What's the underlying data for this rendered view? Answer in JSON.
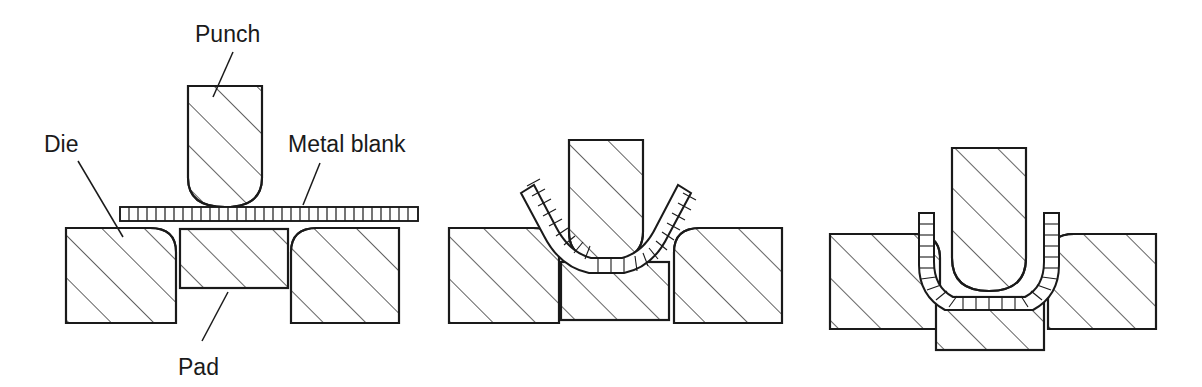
{
  "figure": {
    "background_color": "#ffffff",
    "line_color": "#1a1a1a",
    "hatch_color": "#3c3c3c",
    "width": 1202,
    "height": 387
  },
  "labels": {
    "punch": "Punch",
    "die": "Die",
    "metal_blank": "Metal blank",
    "pad": "Pad"
  },
  "stages": [
    {
      "index": 1,
      "name": "stage-1-initial",
      "description": "Flat metal blank resting on die and pad, punch raised above",
      "blank_state": "flat",
      "punch_position": "raised",
      "pad_position": "up",
      "has_labels": true
    },
    {
      "index": 2,
      "name": "stage-2-partial-bend",
      "description": "Punch descending, blank bent into a V/U around punch nose, pad pushed down",
      "blank_state": "partially-bent",
      "punch_position": "mid-stroke",
      "pad_position": "mid",
      "has_labels": false
    },
    {
      "index": 3,
      "name": "stage-3-formed",
      "description": "Punch fully lowered, blank formed into deep U channel with vertical walls, pad at bottom",
      "blank_state": "fully-formed-u",
      "punch_position": "bottom",
      "pad_position": "down",
      "has_labels": false
    }
  ],
  "components": {
    "punch": {
      "shape": "rounded-bottom-rectangle",
      "hatched": true
    },
    "die_left": {
      "shape": "rectangle-rounded-top-right",
      "hatched": true
    },
    "die_right": {
      "shape": "rectangle-rounded-top-left",
      "hatched": true
    },
    "pad": {
      "shape": "rectangle",
      "hatched": true
    },
    "blank": {
      "shape": "segmented-strip",
      "segments_stage1": 34,
      "hatched": false
    }
  }
}
